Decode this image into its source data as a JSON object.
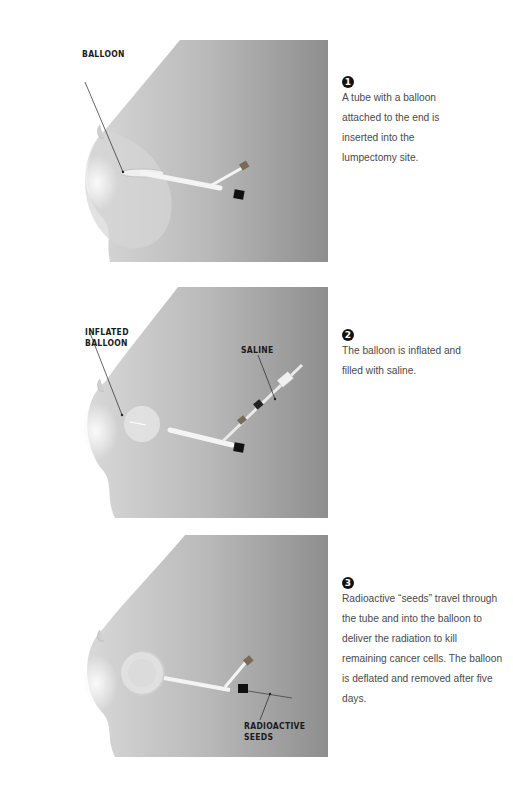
{
  "steps": [
    {
      "number": "1",
      "text": "A tube with a balloon attached to the end is inserted into the lumpectomy site.",
      "labels": [
        "BALLOON"
      ]
    },
    {
      "number": "2",
      "text": "The balloon is inflated and filled with saline.",
      "labels": [
        "INFLATED BALLOON",
        "SALINE"
      ]
    },
    {
      "number": "3",
      "text": "Radioactive “seeds” travel through the tube and into the balloon to deliver the radiation to kill remaining cancer cells. The balloon is deflated and removed after five days.",
      "labels": [
        "RADIOACTIVE SEEDS"
      ]
    }
  ],
  "panel_labels": {
    "p1_balloon": "BALLOON",
    "p2_inflated_1": "INFLATED",
    "p2_inflated_2": "BALLOON",
    "p2_saline": "SALINE",
    "p3_radio_1": "RADIOACTIVE",
    "p3_radio_2": "SEEDS"
  },
  "colors": {
    "background": "#ffffff",
    "skin_light": "#e4e4e4",
    "skin_dark": "#9a9a9a",
    "text": "#4a4a4a",
    "label": "#1a1a1a"
  }
}
